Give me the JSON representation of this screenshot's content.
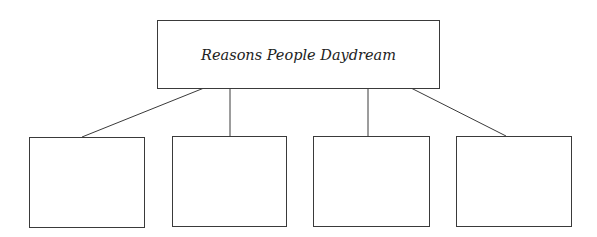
{
  "diagram": {
    "type": "tree",
    "root": {
      "label": "Reasons People Daydream"
    },
    "children": [
      {
        "label": ""
      },
      {
        "label": ""
      },
      {
        "label": ""
      },
      {
        "label": ""
      }
    ],
    "colors": {
      "stroke": "#3a3a3a",
      "background": "#ffffff",
      "text": "#222222"
    }
  }
}
